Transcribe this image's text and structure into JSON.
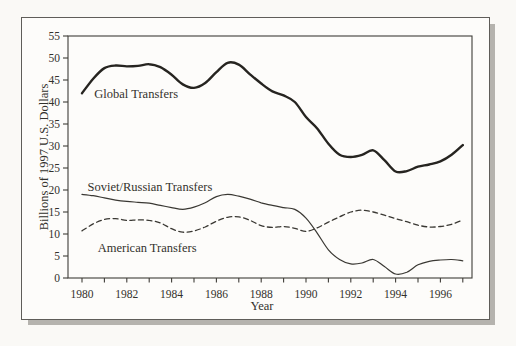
{
  "figure": {
    "background_color": "#faf9f6",
    "frame_border_color": "#5f5d59",
    "frame_shadow_color": "#b5b3ae",
    "axis_color": "#3f3d38",
    "text_color": "#33312c"
  },
  "chart_data": {
    "type": "line",
    "title": "",
    "xlabel": "Year",
    "ylabel": "Billions of 1997 U.S. Dollars",
    "xlim": [
      1980,
      1997
    ],
    "ylim": [
      0,
      55
    ],
    "grid": false,
    "legend_position": "inline-labels",
    "y_ticks": [
      0,
      5,
      10,
      15,
      20,
      25,
      30,
      35,
      40,
      45,
      50,
      55
    ],
    "x_minor_ticks": [
      1980,
      1981,
      1982,
      1983,
      1984,
      1985,
      1986,
      1987,
      1988,
      1989,
      1990,
      1991,
      1992,
      1993,
      1994,
      1995,
      1996,
      1997
    ],
    "x_tick_labels": [
      "1980",
      "1982",
      "1984",
      "1986",
      "1988",
      "1990",
      "1992",
      "1994",
      "1996"
    ],
    "x_tick_label_values": [
      1980,
      1982,
      1984,
      1986,
      1988,
      1990,
      1992,
      1994,
      1996
    ],
    "x": [
      1980,
      1980.5,
      1981,
      1981.5,
      1982,
      1982.5,
      1983,
      1983.5,
      1984,
      1984.5,
      1985,
      1985.5,
      1986,
      1986.5,
      1987,
      1987.5,
      1988,
      1988.5,
      1989,
      1989.5,
      1990,
      1990.5,
      1991,
      1991.5,
      1992,
      1992.5,
      1993,
      1993.5,
      1994,
      1994.5,
      1995,
      1995.5,
      1996,
      1996.5,
      1997
    ],
    "series": [
      {
        "name": "Global Transfers",
        "line": "solid",
        "stroke_width": 2.4,
        "color": "#262420",
        "label_anchor": {
          "x": 1980.55,
          "y": 41.0
        },
        "values": [
          42.0,
          45.3,
          47.7,
          48.3,
          48.1,
          48.2,
          48.6,
          47.9,
          46.2,
          44.0,
          43.2,
          44.3,
          46.8,
          48.9,
          48.5,
          46.3,
          44.2,
          42.4,
          41.5,
          40.0,
          36.6,
          34.0,
          30.5,
          28.0,
          27.5,
          28.0,
          29.0,
          26.8,
          24.2,
          24.3,
          25.3,
          25.8,
          26.5,
          28.0,
          30.2
        ]
      },
      {
        "name": "Soviet/Russian Transfers",
        "line": "solid",
        "stroke_width": 1.2,
        "color": "#3a3833",
        "label_anchor": {
          "x": 1980.25,
          "y": 19.7
        },
        "values": [
          19.0,
          18.7,
          18.2,
          17.7,
          17.4,
          17.2,
          17.0,
          16.5,
          16.0,
          15.6,
          16.1,
          17.1,
          18.5,
          19.0,
          18.6,
          17.9,
          17.1,
          16.5,
          16.0,
          15.6,
          13.6,
          10.2,
          6.4,
          4.2,
          3.2,
          3.4,
          4.2,
          2.6,
          0.9,
          1.3,
          3.0,
          3.8,
          4.1,
          4.2,
          3.9
        ]
      },
      {
        "name": "American Transfers",
        "line": "dashed",
        "stroke_width": 1.3,
        "color": "#3a3833",
        "label_anchor": {
          "x": 1980.7,
          "y": 5.8
        },
        "values": [
          10.7,
          12.3,
          13.3,
          13.5,
          13.1,
          13.2,
          13.1,
          12.5,
          11.2,
          10.4,
          10.7,
          11.6,
          12.9,
          13.8,
          13.9,
          13.1,
          11.9,
          11.5,
          11.7,
          11.3,
          10.6,
          11.4,
          12.7,
          13.9,
          15.0,
          15.4,
          15.0,
          14.3,
          13.5,
          12.8,
          12.0,
          11.6,
          11.7,
          12.2,
          13.2
        ]
      }
    ]
  }
}
